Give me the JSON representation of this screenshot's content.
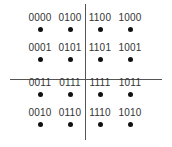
{
  "diagram": {
    "type": "16-QAM Gray-coded constellation",
    "rows": [
      [
        "0000",
        "0100",
        "1100",
        "1000"
      ],
      [
        "0001",
        "0101",
        "1101",
        "1001"
      ],
      [
        "0011",
        "0111",
        "1111",
        "1011"
      ],
      [
        "0010",
        "0110",
        "1110",
        "1010"
      ]
    ]
  }
}
